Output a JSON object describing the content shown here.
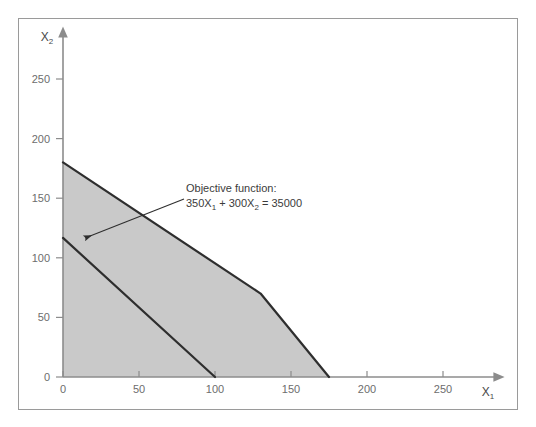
{
  "chart_data": {
    "type": "line",
    "title": "",
    "xlabel": "X1",
    "ylabel": "X2",
    "xlabel_base": "X",
    "xlabel_subscript": "1",
    "ylabel_base": "X",
    "ylabel_subscript": "2",
    "xlim": [
      0,
      275
    ],
    "ylim": [
      0,
      285
    ],
    "grid": false,
    "legend": "none",
    "xticks": [
      0,
      50,
      100,
      150,
      200,
      250
    ],
    "xtick_labels": [
      "0",
      "50",
      "100",
      "150",
      "200",
      "250"
    ],
    "yticks": [
      0,
      50,
      100,
      150,
      200,
      250
    ],
    "ytick_labels": [
      "0",
      "50",
      "100",
      "150",
      "200",
      "250"
    ],
    "annotations": [
      {
        "id": "objective-function",
        "line1": "Objective function:",
        "line2_parts": {
          "c1": "350X",
          "s1": "1",
          "plus": " + ",
          "c2": "300X",
          "s2": "2",
          "equals": " = ",
          "rhs": "35000"
        },
        "line2_plain": "350X1 + 300X2 = 35000",
        "text_x": 186,
        "text_y": 192,
        "arrow_from": [
          184,
          199
        ],
        "arrow_to": [
          85,
          238
        ]
      }
    ],
    "series": [
      {
        "name": "feasible-region",
        "kind": "polygon",
        "fill": "#c9c9c9",
        "points": [
          [
            0,
            0
          ],
          [
            0,
            180
          ],
          [
            130,
            70
          ],
          [
            175,
            0
          ]
        ]
      },
      {
        "name": "constraint-boundary",
        "kind": "line",
        "color": "#2e2e2e",
        "points": [
          [
            0,
            180
          ],
          [
            130,
            70
          ],
          [
            175,
            0
          ]
        ]
      },
      {
        "name": "objective-function-line",
        "kind": "line",
        "color": "#2e2e2e",
        "equation": "350X1 + 300X2 = 35000",
        "points": [
          [
            0,
            116.7
          ],
          [
            100,
            0
          ]
        ]
      }
    ],
    "colors": {
      "region_fill": "#c9c9c9",
      "line": "#2e2e2e",
      "axis": "#8c8c8c",
      "tick_text": "#6d6d6d",
      "frame_border": "#9a9a9a",
      "background": "#ffffff"
    }
  }
}
